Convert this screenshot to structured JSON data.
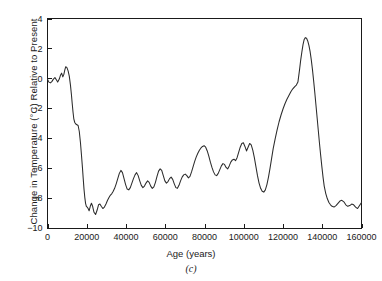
{
  "figure": {
    "panel_caption": "(c)",
    "background_color": "#ffffff",
    "line_color": "#2b2b2b",
    "axis_color": "#1a1a1a"
  },
  "chart_data": {
    "type": "line",
    "title": "",
    "subtitle": "",
    "panel_label": "(c)",
    "xlabel": "Age (years)",
    "ylabel": "Change in Temperature (°C) Relative to Present",
    "xlim": [
      0,
      160000
    ],
    "ylim": [
      -10,
      4
    ],
    "xticks": [
      0,
      20000,
      40000,
      60000,
      80000,
      100000,
      120000,
      140000,
      160000
    ],
    "xtick_labels": [
      "0",
      "20000",
      "40000",
      "60000",
      "80000",
      "100000",
      "120000",
      "140000",
      "160000"
    ],
    "yticks": [
      -10,
      -8,
      -6,
      -4,
      -2,
      0,
      2,
      4
    ],
    "ytick_labels": [
      "−10",
      "−8",
      "−6",
      "−4",
      "−2",
      "0",
      "2",
      "4"
    ],
    "grid": false,
    "legend": false,
    "legend_position": "none",
    "frame": "full-box",
    "series": [
      {
        "name": "Change in Temperature Relative to Present",
        "units": "°C",
        "x": [
          0,
          700,
          1500,
          2300,
          3000,
          3800,
          4500,
          5200,
          6000,
          6600,
          7200,
          7800,
          8300,
          8800,
          9300,
          9900,
          10500,
          11100,
          11700,
          12200,
          12600,
          13000,
          13400,
          13900,
          14400,
          15000,
          15600,
          16200,
          16800,
          17300,
          17800,
          18200,
          18600,
          19000,
          19400,
          19800,
          20200,
          20700,
          21200,
          21800,
          22400,
          23000,
          23700,
          24500,
          25300,
          26000,
          26700,
          27400,
          28200,
          29000,
          29800,
          30600,
          31400,
          32100,
          32800,
          33500,
          34200,
          35000,
          35800,
          36600,
          37400,
          38200,
          39000,
          39800,
          40600,
          41400,
          42200,
          43000,
          43800,
          44600,
          45400,
          46200,
          47000,
          47800,
          48600,
          49400,
          50200,
          51000,
          51800,
          52600,
          53400,
          54200,
          55000,
          55800,
          56600,
          57400,
          58200,
          59000,
          59800,
          60600,
          61400,
          62200,
          63000,
          63800,
          64600,
          65400,
          66200,
          67000,
          67800,
          68600,
          69400,
          70200,
          71000,
          71800,
          72600,
          73400,
          74200,
          75000,
          75800,
          76600,
          77400,
          78200,
          79000,
          79800,
          80600,
          81400,
          82200,
          83000,
          83800,
          84600,
          85400,
          86200,
          87000,
          87800,
          88600,
          89400,
          90200,
          91000,
          91800,
          92600,
          93400,
          94200,
          95000,
          95800,
          96600,
          97400,
          98200,
          99000,
          99800,
          100600,
          101400,
          102200,
          103000,
          103800,
          104600,
          105400,
          106200,
          107000,
          107800,
          108600,
          109400,
          110200,
          111000,
          111800,
          112600,
          113400,
          114200,
          115000,
          116000,
          117000,
          118000,
          119000,
          120000,
          121000,
          122000,
          123000,
          124000,
          125000,
          126000,
          126800,
          127600,
          128400,
          129000,
          129600,
          130200,
          130800,
          131400,
          132000,
          132600,
          133200,
          133800,
          134400,
          135000,
          135600,
          136200,
          136800,
          137400,
          138000,
          138600,
          139200,
          139800,
          140400,
          141000,
          141800,
          142600,
          143400,
          144200,
          145000,
          146000,
          147000,
          148000,
          149000,
          150000,
          151000,
          152000,
          153000,
          154000,
          155000,
          156000,
          157000,
          158000,
          159000,
          160000
        ],
        "y": [
          -0.05,
          -0.25,
          -0.3,
          -0.2,
          -0.05,
          0.05,
          -0.1,
          -0.25,
          -0.05,
          0.2,
          0.35,
          0.1,
          0.25,
          0.55,
          0.78,
          0.72,
          0.5,
          0.15,
          -0.45,
          -1.1,
          -1.7,
          -2.25,
          -2.7,
          -2.95,
          -3.05,
          -3.1,
          -3.15,
          -3.55,
          -4.3,
          -5.1,
          -5.95,
          -6.7,
          -7.4,
          -7.95,
          -8.35,
          -8.55,
          -8.6,
          -8.7,
          -8.85,
          -8.55,
          -8.35,
          -8.55,
          -8.95,
          -9.1,
          -8.8,
          -8.45,
          -8.4,
          -8.55,
          -8.7,
          -8.6,
          -8.4,
          -8.15,
          -7.95,
          -7.8,
          -7.7,
          -7.55,
          -7.35,
          -7.05,
          -6.7,
          -6.35,
          -6.15,
          -6.3,
          -6.7,
          -7.1,
          -7.4,
          -7.45,
          -7.3,
          -7.0,
          -6.7,
          -6.45,
          -6.3,
          -6.5,
          -6.85,
          -7.15,
          -7.3,
          -7.2,
          -7.0,
          -6.85,
          -6.95,
          -7.2,
          -7.35,
          -7.25,
          -6.95,
          -6.55,
          -6.2,
          -6.05,
          -6.15,
          -6.5,
          -6.85,
          -7.0,
          -6.9,
          -6.7,
          -6.6,
          -6.75,
          -7.05,
          -7.3,
          -7.35,
          -7.15,
          -6.85,
          -6.6,
          -6.45,
          -6.4,
          -6.5,
          -6.65,
          -6.55,
          -6.25,
          -5.9,
          -5.55,
          -5.25,
          -5.0,
          -4.8,
          -4.65,
          -4.55,
          -4.5,
          -4.6,
          -4.85,
          -5.2,
          -5.6,
          -5.95,
          -6.25,
          -6.45,
          -6.5,
          -6.35,
          -6.1,
          -5.85,
          -5.7,
          -5.75,
          -5.95,
          -6.05,
          -5.85,
          -5.6,
          -5.45,
          -5.4,
          -5.5,
          -5.3,
          -4.95,
          -4.6,
          -4.35,
          -4.3,
          -4.55,
          -4.85,
          -4.6,
          -4.35,
          -4.45,
          -4.8,
          -5.3,
          -5.9,
          -6.5,
          -7.0,
          -7.35,
          -7.55,
          -7.6,
          -7.45,
          -7.1,
          -6.6,
          -6.0,
          -5.35,
          -4.7,
          -4.05,
          -3.45,
          -2.9,
          -2.45,
          -2.05,
          -1.7,
          -1.4,
          -1.15,
          -0.9,
          -0.7,
          -0.55,
          -0.45,
          -0.25,
          0.55,
          1.2,
          1.75,
          2.25,
          2.6,
          2.72,
          2.68,
          2.5,
          2.2,
          1.8,
          1.25,
          0.6,
          -0.15,
          -0.95,
          -1.8,
          -2.65,
          -3.5,
          -4.35,
          -5.15,
          -5.9,
          -6.6,
          -7.2,
          -7.7,
          -8.05,
          -8.3,
          -8.45,
          -8.55,
          -8.6,
          -8.5,
          -8.35,
          -8.2,
          -8.15,
          -8.25,
          -8.45,
          -8.55,
          -8.5,
          -8.4,
          -8.45,
          -8.6,
          -8.7,
          -8.5,
          -8.3
        ]
      }
    ]
  }
}
